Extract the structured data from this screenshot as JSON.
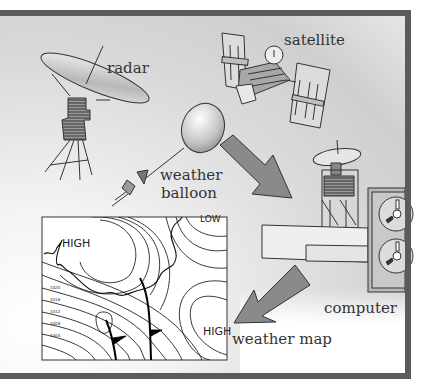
{
  "diagram": {
    "labels": {
      "radar": "radar",
      "satellite": "satellite",
      "weather_balloon_line1": "weather",
      "weather_balloon_line2": "balloon",
      "computer": "computer",
      "weather_map": "weather map"
    },
    "map_labels": {
      "high_top_left": "HIGH",
      "low_top_right": "LOW",
      "high_bottom_right": "HIGH",
      "isobar_values": [
        "1020",
        "1016",
        "1012",
        "1008",
        "1004"
      ]
    },
    "colors": {
      "frame": "#5b5b5b",
      "arrow": "#8a8a8a",
      "line": "#333333",
      "map_bg": "#ffffff"
    }
  }
}
